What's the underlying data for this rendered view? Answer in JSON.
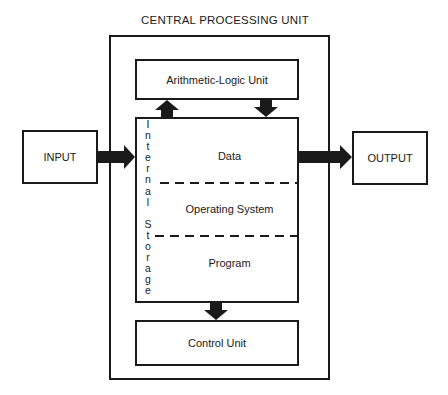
{
  "diagram": {
    "title": "CENTRAL PROCESSING UNIT",
    "input": {
      "label": "INPUT"
    },
    "output": {
      "label": "OUTPUT"
    },
    "cpu": {
      "alu": {
        "label": "Arithmetic-Logic Unit"
      },
      "internal_storage": {
        "vertical_label": "Internal Storage",
        "vertical_letters": [
          "I",
          "n",
          "t",
          "e",
          "r",
          "n",
          "a",
          "l",
          " ",
          "S",
          "t",
          "o",
          "r",
          "a",
          "g",
          "e"
        ],
        "sections": [
          {
            "label": "Data"
          },
          {
            "label": "Operating System"
          },
          {
            "label": "Program"
          }
        ]
      },
      "control_unit": {
        "label": "Control Unit"
      }
    },
    "arrows": [
      {
        "from": "input",
        "to": "internal_storage"
      },
      {
        "from": "internal_storage",
        "to": "output"
      },
      {
        "from": "internal_storage",
        "to": "alu"
      },
      {
        "from": "alu",
        "to": "internal_storage"
      },
      {
        "from": "internal_storage",
        "to": "control_unit"
      }
    ],
    "colors": {
      "line": "#1a1a1a",
      "background": "#ffffff"
    }
  }
}
